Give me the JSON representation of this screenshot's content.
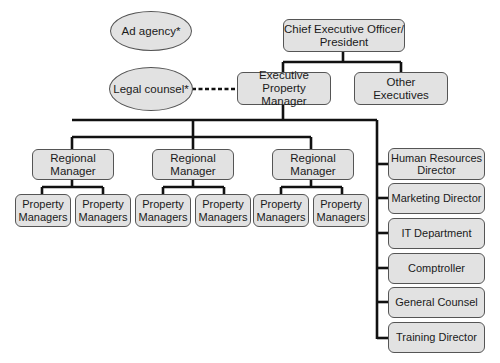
{
  "diagram": {
    "type": "org-chart",
    "external": [
      {
        "id": "ad_agency",
        "label": "Ad agency*"
      },
      {
        "id": "legal_counsel",
        "label": "Legal counsel*"
      }
    ],
    "ceo": {
      "label": "Chief Executive Officer/\nPresident"
    },
    "level2": [
      {
        "id": "epm",
        "label": "Executive\nProperty Manager"
      },
      {
        "id": "other",
        "label": "Other\nExecutives"
      }
    ],
    "regional": [
      {
        "label": "Regional\nManager",
        "children": [
          "Property\nManagers",
          "Property\nManagers"
        ]
      },
      {
        "label": "Regional\nManager",
        "children": [
          "Property\nManagers",
          "Property\nManagers"
        ]
      },
      {
        "label": "Regional\nManager",
        "children": [
          "Property\nManagers",
          "Property\nManagers"
        ]
      }
    ],
    "staff": [
      {
        "label": "Human Resources\nDirector"
      },
      {
        "label": "Marketing Director"
      },
      {
        "label": "IT Department"
      },
      {
        "label": "Comptroller"
      },
      {
        "label": "General Counsel"
      },
      {
        "label": "Training Director"
      }
    ],
    "colors": {
      "box_fill": "#e2e2e2",
      "box_border": "#555555",
      "line": "#111111"
    }
  }
}
